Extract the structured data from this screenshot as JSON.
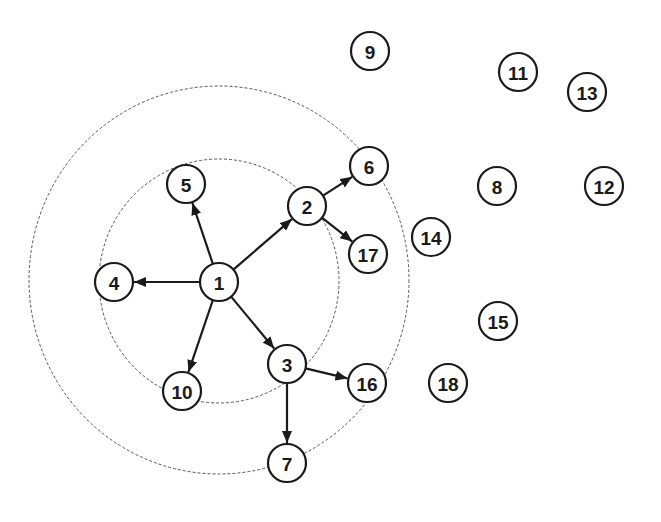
{
  "diagram": {
    "type": "directed-graph",
    "colors": {
      "node_stroke": "#1a1a1a",
      "node_fill": "#ffffff",
      "edge": "#1a1a1a",
      "ring": "#555555",
      "background": "#ffffff"
    },
    "node_radius": 19,
    "rings": [
      {
        "id": "ring-1-hop",
        "cx": 219,
        "cy": 281,
        "rx": 120,
        "ry": 122
      },
      {
        "id": "ring-2-hop",
        "cx": 219,
        "cy": 280,
        "rx": 190,
        "ry": 194
      }
    ],
    "nodes": [
      {
        "id": "1",
        "label": "1",
        "x": 219,
        "y": 282
      },
      {
        "id": "2",
        "label": "2",
        "x": 307,
        "y": 206
      },
      {
        "id": "3",
        "label": "3",
        "x": 287,
        "y": 364
      },
      {
        "id": "4",
        "label": "4",
        "x": 114,
        "y": 282
      },
      {
        "id": "5",
        "label": "5",
        "x": 186,
        "y": 184
      },
      {
        "id": "6",
        "label": "6",
        "x": 369,
        "y": 166
      },
      {
        "id": "7",
        "label": "7",
        "x": 287,
        "y": 463
      },
      {
        "id": "8",
        "label": "8",
        "x": 497,
        "y": 186
      },
      {
        "id": "9",
        "label": "9",
        "x": 370,
        "y": 51
      },
      {
        "id": "10",
        "label": "10",
        "x": 182,
        "y": 391
      },
      {
        "id": "11",
        "label": "11",
        "x": 518,
        "y": 72
      },
      {
        "id": "12",
        "label": "12",
        "x": 604,
        "y": 186
      },
      {
        "id": "13",
        "label": "13",
        "x": 587,
        "y": 92
      },
      {
        "id": "14",
        "label": "14",
        "x": 431,
        "y": 237
      },
      {
        "id": "15",
        "label": "15",
        "x": 498,
        "y": 321
      },
      {
        "id": "16",
        "label": "16",
        "x": 367,
        "y": 383
      },
      {
        "id": "17",
        "label": "17",
        "x": 368,
        "y": 254
      },
      {
        "id": "18",
        "label": "18",
        "x": 448,
        "y": 383
      }
    ],
    "edges": [
      {
        "from": "1",
        "to": "2"
      },
      {
        "from": "1",
        "to": "3"
      },
      {
        "from": "1",
        "to": "4"
      },
      {
        "from": "1",
        "to": "5"
      },
      {
        "from": "1",
        "to": "10"
      },
      {
        "from": "2",
        "to": "6"
      },
      {
        "from": "2",
        "to": "17"
      },
      {
        "from": "3",
        "to": "7"
      },
      {
        "from": "3",
        "to": "16"
      }
    ]
  }
}
